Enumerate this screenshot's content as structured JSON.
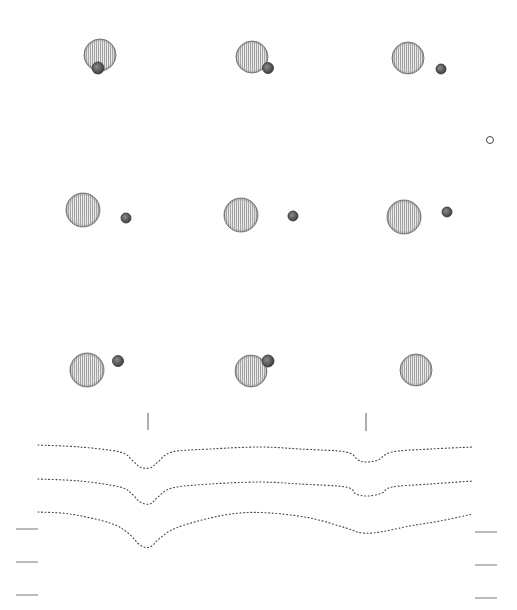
{
  "figure": {
    "colors": {
      "background": "#ffffff",
      "planet_fill": "#e6e6e6",
      "planet_stripe": "#9a9a9a",
      "planet_edge": "#555555",
      "moon_fill": "#6a6a6a",
      "moon_edge": "#333333",
      "curve": "#444444",
      "tick": "#777777"
    },
    "frames": [
      {
        "id": 1,
        "planet": {
          "cx": 100,
          "cy": 55,
          "r": 16
        },
        "moon": {
          "cx": 98,
          "cy": 68,
          "r": 6,
          "visible": true,
          "in_front": true
        }
      },
      {
        "id": 2,
        "planet": {
          "cx": 252,
          "cy": 57,
          "r": 16
        },
        "moon": {
          "cx": 268,
          "cy": 68,
          "r": 5.5,
          "visible": true,
          "in_front": true
        }
      },
      {
        "id": 3,
        "planet": {
          "cx": 408,
          "cy": 58,
          "r": 16
        },
        "moon": {
          "cx": 441,
          "cy": 69,
          "r": 5,
          "visible": true,
          "in_front": true
        }
      },
      {
        "id": 4,
        "planet": {
          "cx": 83,
          "cy": 210,
          "r": 17
        },
        "moon": {
          "cx": 126,
          "cy": 218,
          "r": 5,
          "visible": true,
          "in_front": true
        }
      },
      {
        "id": 5,
        "planet": {
          "cx": 241,
          "cy": 215,
          "r": 17
        },
        "moon": {
          "cx": 293,
          "cy": 216,
          "r": 5,
          "visible": true,
          "in_front": true
        }
      },
      {
        "id": 6,
        "planet": {
          "cx": 404,
          "cy": 217,
          "r": 17
        },
        "moon": {
          "cx": 447,
          "cy": 212,
          "r": 5,
          "visible": true,
          "in_front": true
        }
      },
      {
        "id": 7,
        "planet": {
          "cx": 87,
          "cy": 370,
          "r": 17
        },
        "moon": {
          "cx": 118,
          "cy": 361,
          "r": 5.5,
          "visible": true,
          "in_front": true
        }
      },
      {
        "id": 8,
        "planet": {
          "cx": 251,
          "cy": 371,
          "r": 16
        },
        "moon": {
          "cx": 268,
          "cy": 361,
          "r": 6,
          "visible": true,
          "in_front": true
        }
      },
      {
        "id": 9,
        "planet": {
          "cx": 416,
          "cy": 370,
          "r": 16
        },
        "moon": {
          "cx": 416,
          "cy": 370,
          "r": 6,
          "visible": false,
          "in_front": false
        }
      }
    ],
    "small_marker": {
      "cx": 490,
      "cy": 140,
      "r": 3.5
    },
    "event_ticks": [
      {
        "x": 148,
        "y1": 413,
        "y2": 430
      },
      {
        "x": 366,
        "y1": 413,
        "y2": 431
      }
    ],
    "light_curves": [
      {
        "name": "curve-top",
        "points": [
          [
            38,
            445
          ],
          [
            80,
            447
          ],
          [
            120,
            452
          ],
          [
            132,
            460
          ],
          [
            140,
            467
          ],
          [
            150,
            468
          ],
          [
            158,
            462
          ],
          [
            172,
            452
          ],
          [
            210,
            449
          ],
          [
            260,
            447
          ],
          [
            300,
            449
          ],
          [
            346,
            452
          ],
          [
            358,
            460
          ],
          [
            366,
            462
          ],
          [
            378,
            460
          ],
          [
            392,
            452
          ],
          [
            430,
            449
          ],
          [
            473,
            447
          ]
        ]
      },
      {
        "name": "curve-middle",
        "points": [
          [
            38,
            479
          ],
          [
            80,
            481
          ],
          [
            120,
            487
          ],
          [
            132,
            494
          ],
          [
            140,
            502
          ],
          [
            150,
            504
          ],
          [
            158,
            497
          ],
          [
            172,
            488
          ],
          [
            210,
            484
          ],
          [
            260,
            482
          ],
          [
            300,
            484
          ],
          [
            346,
            487
          ],
          [
            356,
            494
          ],
          [
            368,
            496
          ],
          [
            382,
            493
          ],
          [
            392,
            487
          ],
          [
            430,
            484
          ],
          [
            473,
            481
          ]
        ]
      },
      {
        "name": "curve-bottom",
        "points": [
          [
            38,
            512
          ],
          [
            70,
            514
          ],
          [
            110,
            523
          ],
          [
            128,
            533
          ],
          [
            140,
            545
          ],
          [
            150,
            547
          ],
          [
            160,
            538
          ],
          [
            176,
            528
          ],
          [
            210,
            518
          ],
          [
            240,
            513
          ],
          [
            270,
            513
          ],
          [
            310,
            518
          ],
          [
            346,
            528
          ],
          [
            362,
            533
          ],
          [
            380,
            532
          ],
          [
            410,
            526
          ],
          [
            440,
            521
          ],
          [
            473,
            514
          ]
        ]
      }
    ],
    "scale_ticks_left": [
      {
        "x1": 16,
        "x2": 38,
        "y": 529
      },
      {
        "x1": 16,
        "x2": 38,
        "y": 562
      },
      {
        "x1": 16,
        "x2": 38,
        "y": 595
      }
    ],
    "scale_ticks_right": [
      {
        "x1": 475,
        "x2": 497,
        "y": 532
      },
      {
        "x1": 475,
        "x2": 497,
        "y": 565
      },
      {
        "x1": 475,
        "x2": 497,
        "y": 598
      }
    ]
  }
}
